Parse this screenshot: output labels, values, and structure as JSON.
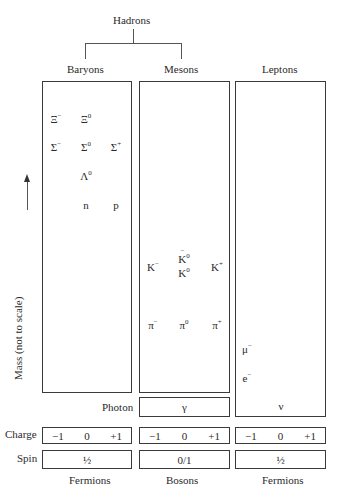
{
  "title": "Hadrons",
  "columns": [
    {
      "label": "Baryons"
    },
    {
      "label": "Mesons"
    },
    {
      "label": "Leptons"
    }
  ],
  "axis": {
    "label": "Mass (not to scale)",
    "arrow": "up-arrow"
  },
  "baryons": {
    "xi_minus": {
      "sym": "Ξ",
      "ch": "−"
    },
    "xi_zero": {
      "sym": "Ξ",
      "ch": "0"
    },
    "sigma_minus": {
      "sym": "Σ",
      "ch": "−"
    },
    "sigma_zero": {
      "sym": "Σ",
      "ch": "0"
    },
    "sigma_plus": {
      "sym": "Σ",
      "ch": "+"
    },
    "lambda_zero": {
      "sym": "Λ",
      "ch": "0"
    },
    "neutron": {
      "sym": "n"
    },
    "proton": {
      "sym": "p"
    }
  },
  "mesons": {
    "k_minus": {
      "sym": "K",
      "ch": "−"
    },
    "k_zero_bar": {
      "sym": "K",
      "ch": "0"
    },
    "k_zero": {
      "sym": "K",
      "ch": "0"
    },
    "k_plus": {
      "sym": "K",
      "ch": "+"
    },
    "pi_minus": {
      "sym": "π",
      "ch": "−"
    },
    "pi_zero": {
      "sym": "π",
      "ch": "0"
    },
    "pi_plus": {
      "sym": "π",
      "ch": "+"
    }
  },
  "leptons": {
    "muon": {
      "sym": "μ",
      "ch": "−"
    },
    "electron": {
      "sym": "e",
      "ch": "−"
    },
    "neutrino": {
      "sym": "ν"
    }
  },
  "photon": {
    "label": "Photon",
    "sym": "γ"
  },
  "charge": {
    "label": "Charge",
    "values": [
      "−1",
      "0",
      "+1"
    ]
  },
  "spin": {
    "label": "Spin",
    "values": [
      "½",
      "0/1",
      "½"
    ]
  },
  "statistics": [
    "Fermions",
    "Bosons",
    "Fermions"
  ]
}
